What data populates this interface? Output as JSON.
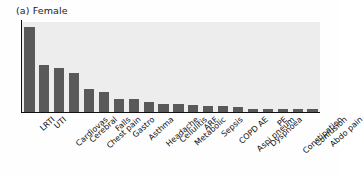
{
  "panel": {
    "title": "(a) Female"
  },
  "colors": {
    "bar_fill": "#595959",
    "plot_background": "#ededed",
    "axis": "#111111",
    "figure_background": "#fefefe",
    "text": "#111111"
  },
  "chart_data": {
    "type": "bar",
    "title": "(a) Female",
    "xlabel": "",
    "ylabel": "",
    "grid": false,
    "legend": null,
    "ylim": [
      0,
      100
    ],
    "categories": [
      "LRTI",
      "UTI",
      "Cardiovas",
      "Cerebral",
      "Chest pain",
      "Falls",
      "Gastro",
      "Asthma",
      "Headache",
      "Cellulitis",
      "Metabolic",
      "ARF",
      "Sepsis",
      "COPD AE",
      "Aspi pneum",
      "Dyspnoea",
      "PE",
      "Constipation",
      "Confusion",
      "Abdo pain"
    ],
    "values": [
      95,
      52,
      49,
      43,
      26,
      22,
      14,
      14,
      11,
      9,
      9,
      8,
      7,
      7,
      6,
      3,
      3,
      3,
      3,
      3
    ]
  }
}
